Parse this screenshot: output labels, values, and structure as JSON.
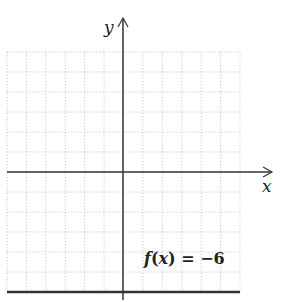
{
  "chart_data": {
    "type": "line",
    "title": "",
    "xlabel": "x",
    "ylabel": "y",
    "xlim": [
      -6,
      6
    ],
    "ylim": [
      -6,
      6
    ],
    "grid": true,
    "grid_style": "dotted",
    "series": [
      {
        "name": "f(x) = −6",
        "x": [
          -6,
          6
        ],
        "y": [
          -6,
          -6
        ]
      }
    ],
    "annotations": [
      {
        "text": "f(x) = −6",
        "x": 1,
        "y": -5
      }
    ],
    "tick_labels_shown": false
  },
  "axes": {
    "x_label": "x",
    "y_label": "y"
  },
  "function_label": {
    "name": "f",
    "arg": "x",
    "equals": "=",
    "value": "−6"
  },
  "colors": {
    "grid": "#b8b8b8",
    "axis": "#333333",
    "function_line": "#333333"
  }
}
